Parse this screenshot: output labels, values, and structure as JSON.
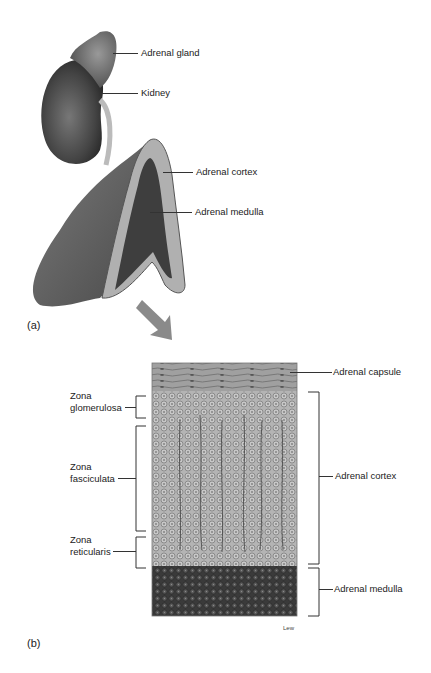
{
  "figure": {
    "panel_a": {
      "tag": "(a)",
      "labels": {
        "adrenal_gland": "Adrenal gland",
        "kidney": "Kidney",
        "adrenal_cortex": "Adrenal cortex",
        "adrenal_medulla": "Adrenal medulla"
      }
    },
    "panel_b": {
      "tag": "(b)",
      "left_labels": {
        "zona_glomerulosa": [
          "Zona",
          "glomerulosa"
        ],
        "zona_fasciculata": [
          "Zona",
          "fasciculata"
        ],
        "zona_reticularis": [
          "Zona",
          "reticularis"
        ]
      },
      "right_labels": {
        "adrenal_capsule": "Adrenal capsule",
        "adrenal_cortex": "Adrenal cortex",
        "adrenal_medulla": "Adrenal medulla"
      },
      "artist_signature": "Lew"
    },
    "colors": {
      "kidney": "#4a4a4a",
      "gland": "#6a6a6a",
      "cortex": "#a8a8a8",
      "medulla": "#3c3c3c",
      "arrow": "#8a8a8a",
      "capsule": "#9a9a9a"
    }
  }
}
